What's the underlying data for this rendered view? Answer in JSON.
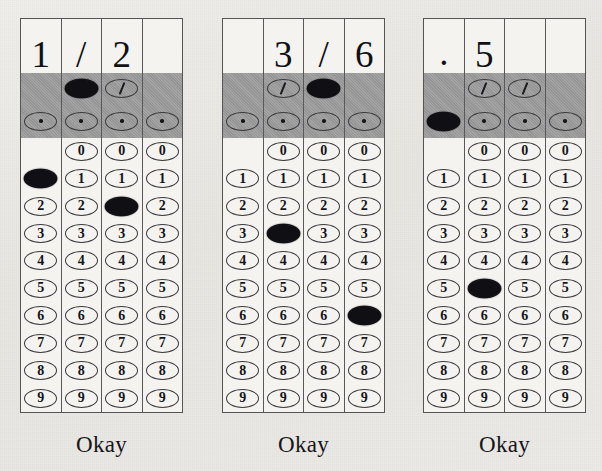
{
  "page": {
    "background_color": "#e9e8e4",
    "ink_color": "#100f14",
    "shade_band_color": "#9a9a9a",
    "grid_count": 3
  },
  "symbols": {
    "slash": "/",
    "decimal_point": ".",
    "dot_glyph": "·"
  },
  "digit_labels": [
    "0",
    "1",
    "2",
    "3",
    "4",
    "5",
    "6",
    "7",
    "8",
    "9"
  ],
  "grids": [
    {
      "id": "grid-1",
      "written_answer": "1/2",
      "okay_label": "Okay",
      "columns": [
        {
          "index": 1,
          "written": "1",
          "has_slash_bubble": false,
          "has_decimal_bubble": true,
          "has_zero_bubble": false,
          "slash_filled": false,
          "decimal_filled": false,
          "filled_digit": "1"
        },
        {
          "index": 2,
          "written": "/",
          "has_slash_bubble": true,
          "has_decimal_bubble": true,
          "has_zero_bubble": true,
          "slash_filled": true,
          "decimal_filled": false,
          "filled_digit": null
        },
        {
          "index": 3,
          "written": "2",
          "has_slash_bubble": true,
          "has_decimal_bubble": true,
          "has_zero_bubble": true,
          "slash_filled": false,
          "decimal_filled": false,
          "filled_digit": "2"
        },
        {
          "index": 4,
          "written": "",
          "has_slash_bubble": false,
          "has_decimal_bubble": true,
          "has_zero_bubble": true,
          "slash_filled": false,
          "decimal_filled": false,
          "filled_digit": null
        }
      ]
    },
    {
      "id": "grid-2",
      "written_answer": "3/6",
      "okay_label": "Okay",
      "columns": [
        {
          "index": 1,
          "written": "",
          "has_slash_bubble": false,
          "has_decimal_bubble": true,
          "has_zero_bubble": false,
          "slash_filled": false,
          "decimal_filled": false,
          "filled_digit": null
        },
        {
          "index": 2,
          "written": "3",
          "has_slash_bubble": true,
          "has_decimal_bubble": true,
          "has_zero_bubble": true,
          "slash_filled": false,
          "decimal_filled": false,
          "filled_digit": "3"
        },
        {
          "index": 3,
          "written": "/",
          "has_slash_bubble": true,
          "has_decimal_bubble": true,
          "has_zero_bubble": true,
          "slash_filled": true,
          "decimal_filled": false,
          "filled_digit": null
        },
        {
          "index": 4,
          "written": "6",
          "has_slash_bubble": false,
          "has_decimal_bubble": true,
          "has_zero_bubble": true,
          "slash_filled": false,
          "decimal_filled": false,
          "filled_digit": "6"
        }
      ]
    },
    {
      "id": "grid-3",
      "written_answer": ".5",
      "okay_label": "Okay",
      "columns": [
        {
          "index": 1,
          "written": ".",
          "has_slash_bubble": false,
          "has_decimal_bubble": true,
          "has_zero_bubble": false,
          "slash_filled": false,
          "decimal_filled": true,
          "filled_digit": null
        },
        {
          "index": 2,
          "written": "5",
          "has_slash_bubble": true,
          "has_decimal_bubble": true,
          "has_zero_bubble": true,
          "slash_filled": false,
          "decimal_filled": false,
          "filled_digit": "5"
        },
        {
          "index": 3,
          "written": "",
          "has_slash_bubble": true,
          "has_decimal_bubble": true,
          "has_zero_bubble": true,
          "slash_filled": false,
          "decimal_filled": false,
          "filled_digit": null
        },
        {
          "index": 4,
          "written": "",
          "has_slash_bubble": false,
          "has_decimal_bubble": true,
          "has_zero_bubble": true,
          "slash_filled": false,
          "decimal_filled": false,
          "filled_digit": null
        }
      ]
    }
  ]
}
